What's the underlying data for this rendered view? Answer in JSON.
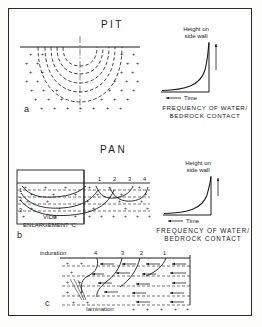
{
  "figure": {
    "panels": [
      {
        "id": "a",
        "letter": "a",
        "title": "PIT",
        "diagram": {
          "name": "pit-cross-section",
          "feature_markers": "+",
          "contour_count": 5
        },
        "graph": {
          "y_axis_label_line1": "Height on",
          "y_axis_label_line2": "side wall",
          "x_axis_label": "Time",
          "x_axis_arrow_direction": "left",
          "caption_line1": "FREQUENCY OF WATER/",
          "caption_line2": "BEDROCK CONTACT",
          "curve_shape": "exponential-rise-at-right"
        }
      },
      {
        "id": "b",
        "letter": "b",
        "title": "PAN",
        "diagram": {
          "name": "pan-cross-section",
          "stage_numbers": [
            "1",
            "2",
            "3",
            "4"
          ],
          "layer_numbers": [
            "1",
            "2",
            "3"
          ],
          "label_line1": "VIDE",
          "label_line2": "ENLARGEMENT 'C'",
          "feature_markers": "+"
        },
        "graph": {
          "y_axis_label_line1": "Height on",
          "y_axis_label_line2": "side wall",
          "x_axis_label": "Time",
          "x_axis_arrow_direction": "left",
          "caption_line1": "FREQUENCY OF WATER/",
          "caption_line2": "BEDROCK CONTACT",
          "curve_shape": "exponential-rise-at-right"
        }
      },
      {
        "id": "c",
        "letter": "c",
        "title": "",
        "diagram": {
          "name": "vide-enlargement-detail",
          "top_label": "induration",
          "bottom_label": "lamination",
          "stage_numbers": [
            "4",
            "3",
            "2",
            "1"
          ],
          "feature_markers": "+",
          "flow_arrow_direction": "right-to-left"
        }
      }
    ],
    "colors": {
      "ink": "#1a1a1a",
      "paper": "#ffffff",
      "border": "#2a2a2a"
    }
  }
}
